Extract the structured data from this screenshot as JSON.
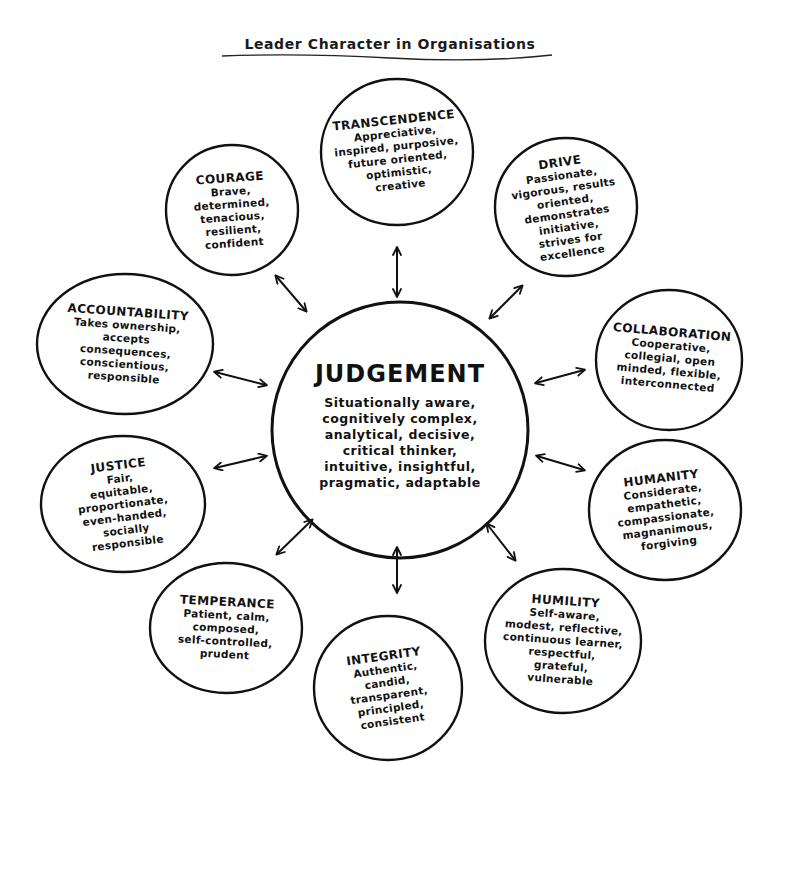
{
  "title": "Leader Character in Organisations",
  "center": {
    "name": "JUDGEMENT",
    "description": "Situationally aware,\ncognitively complex,\nanalytical, decisive,\ncritical thinker,\nintuitive, insightful,\npragmatic, adaptable"
  },
  "dimensions": {
    "transcendence": {
      "name": "TRANSCENDENCE",
      "description": "Appreciative,\ninspired, purposive,\nfuture oriented,\noptimistic,\ncreative"
    },
    "courage": {
      "name": "COURAGE",
      "description": "Brave,\ndetermined,\ntenacious,\nresilient,\nconfident"
    },
    "drive": {
      "name": "DRIVE",
      "description": "Passionate,\nvigorous, results\noriented,\ndemonstrates\ninitiative,\nstrives for\nexcellence"
    },
    "accountability": {
      "name": "ACCOUNTABILITY",
      "description": "Takes ownership,\naccepts\nconsequences,\nconscientious,\nresponsible"
    },
    "collaboration": {
      "name": "COLLABORATION",
      "description": "Cooperative,\ncollegial, open\nminded, flexible,\ninterconnected"
    },
    "justice": {
      "name": "JUSTICE",
      "description": "Fair,\nequitable,\nproportionate,\neven-handed,\nsocially\nresponsible"
    },
    "humanity": {
      "name": "HUMANITY",
      "description": "Considerate,\nempathetic,\ncompassionate,\nmagnanimous,\nforgiving"
    },
    "temperance": {
      "name": "TEMPERANCE",
      "description": "Patient, calm,\ncomposed,\nself-controlled,\nprudent"
    },
    "integrity": {
      "name": "INTEGRITY",
      "description": "Authentic,\ncandid,\ntransparent,\nprincipled,\nconsistent"
    },
    "humility": {
      "name": "HUMILITY",
      "description": "Self-aware,\nmodest, reflective,\ncontinuous learner,\nrespectful,\ngrateful,\nvulnerable"
    }
  },
  "connector": "double-arrow-icon",
  "colors": {
    "ink": "#111111",
    "background": "#ffffff"
  }
}
